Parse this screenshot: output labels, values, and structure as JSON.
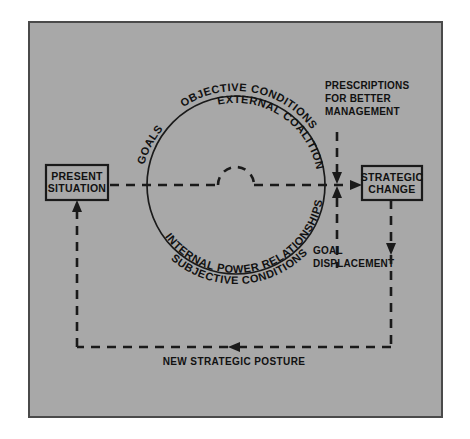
{
  "figure": {
    "panel": {
      "background_color": "#a8a8a8",
      "border_color": "#4a4a4a",
      "page_background": "#ffffff"
    },
    "ink_color": "#1a1a1a"
  },
  "nodes": {
    "present_situation": {
      "line1": "PRESENT",
      "line2": "SITUATION"
    },
    "strategic_change": {
      "line1": "STRATEGIC",
      "line2": "CHANGE"
    }
  },
  "circle_labels": {
    "top_outer": "OBJECTIVE CONDITIONS",
    "top_inner": "EXTERNAL COALITION",
    "top_left_small": "GOALS",
    "bottom_outer": "INTERNAL POWER RELATIONSHIPS",
    "bottom_inner": "SUBJECTIVE CONDITIONS"
  },
  "side_labels": {
    "prescriptions": {
      "line1": "PRESCRIPTIONS",
      "line2": "FOR BETTER",
      "line3": "MANAGEMENT"
    },
    "goal_displacement": {
      "line1": "GOAL",
      "line2": "DISPLACEMENT"
    }
  },
  "flow_labels": {
    "feedback": "NEW STRATEGIC POSTURE"
  }
}
